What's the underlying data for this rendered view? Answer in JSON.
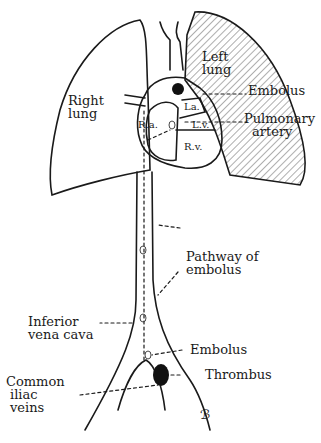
{
  "diagram": {
    "labels": {
      "right_lung": [
        "Right",
        "lung"
      ],
      "left_lung": [
        "Left",
        "lung"
      ],
      "embolus_top": "Embolus",
      "pulmonary_artery": [
        "Pulmonary",
        "artery"
      ],
      "ra": "R.a.",
      "la": "La.",
      "lv": "L.v.",
      "rv": "R.v.",
      "pathway": [
        "Pathway of",
        "embolus"
      ],
      "ivc": [
        "Inferior",
        "vena cava"
      ],
      "embolus_bottom": "Embolus",
      "thrombus": "Thrombus",
      "iliac": [
        "Common",
        "iliac",
        "veins"
      ],
      "signature": "ℬ"
    },
    "colors": {
      "ink": "#1a1a1a",
      "background": "#ffffff"
    }
  }
}
